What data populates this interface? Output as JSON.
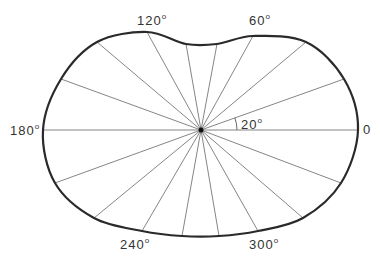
{
  "diagram": {
    "center": [
      201,
      130
    ],
    "outline_color": "#2a2a2a",
    "ray_color": "#777777",
    "text_color": "#333333",
    "ray_angle_step_deg": 20,
    "rays": [
      {
        "angle": 0,
        "end": [
          358,
          130
        ]
      },
      {
        "angle": 20,
        "end": [
          344,
          79
        ]
      },
      {
        "angle": 40,
        "end": [
          306,
          42
        ]
      },
      {
        "angle": 60,
        "end": [
          253,
          36
        ]
      },
      {
        "angle": 80,
        "end": [
          217,
          44
        ]
      },
      {
        "angle": 100,
        "end": [
          186,
          44
        ]
      },
      {
        "angle": 120,
        "end": [
          147,
          32
        ]
      },
      {
        "angle": 140,
        "end": [
          97,
          42
        ]
      },
      {
        "angle": 160,
        "end": [
          61,
          79
        ]
      },
      {
        "angle": 180,
        "end": [
          43,
          130
        ]
      },
      {
        "angle": 200,
        "end": [
          55,
          183
        ]
      },
      {
        "angle": 220,
        "end": [
          94,
          218
        ]
      },
      {
        "angle": 240,
        "end": [
          142,
          231
        ]
      },
      {
        "angle": 260,
        "end": [
          182,
          236
        ]
      },
      {
        "angle": 280,
        "end": [
          219,
          236
        ]
      },
      {
        "angle": 300,
        "end": [
          258,
          231
        ]
      },
      {
        "angle": 320,
        "end": [
          303,
          218
        ]
      },
      {
        "angle": 340,
        "end": [
          341,
          183
        ]
      }
    ],
    "labels": {
      "deg0": {
        "value": "0",
        "sup": ""
      },
      "deg60": {
        "value": "60",
        "sup": "o"
      },
      "deg120": {
        "value": "120",
        "sup": "o"
      },
      "deg180": {
        "value": "180",
        "sup": "o"
      },
      "deg240": {
        "value": "240",
        "sup": "o"
      },
      "deg300": {
        "value": "300",
        "sup": "o"
      },
      "angle_marker": {
        "value": "20",
        "sup": "o"
      }
    }
  }
}
